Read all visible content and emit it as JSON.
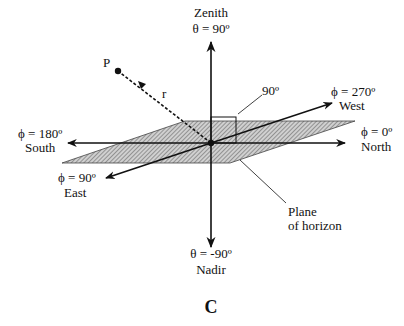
{
  "colors": {
    "ink": "#111111",
    "background": "#ffffff",
    "hatch_fill": "#bdbdbd"
  },
  "labels": {
    "zenith_name": "Zenith",
    "zenith_angle": "θ = 90º",
    "nadir_angle": "θ = -90º",
    "nadir_name": "Nadir",
    "point": "P",
    "radius": "r",
    "right_angle": "90º",
    "west_angle": "ϕ = 270º",
    "west_name": "West",
    "north_angle": "ϕ = 0º",
    "north_name": "North",
    "south_angle": "ϕ = 180º",
    "south_name": "South",
    "east_angle": "ϕ = 90º",
    "east_name": "East",
    "plane_line1": "Plane",
    "plane_line2": "of horizon",
    "panel_letter": "C"
  }
}
